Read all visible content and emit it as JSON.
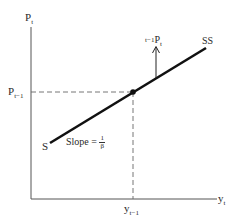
{
  "diagram": {
    "y_axis": {
      "label_main": "P",
      "label_sub": "t"
    },
    "x_axis": {
      "label_main": "y",
      "label_sub": "t"
    },
    "y_marker": {
      "label_main": "P",
      "label_sub": "t−1"
    },
    "x_marker": {
      "label_main": "y",
      "label_sub": "t−1"
    },
    "line": {
      "start_label": "S",
      "end_label": "SS",
      "slope_label": "Slope =",
      "slope_num": "1",
      "slope_den": "β"
    },
    "arrow_label": {
      "prefix": "t−1",
      "main": "P",
      "sub": "t"
    },
    "colors": {
      "line": "#111111",
      "axis": "#555555",
      "dashed": "#666666"
    }
  }
}
